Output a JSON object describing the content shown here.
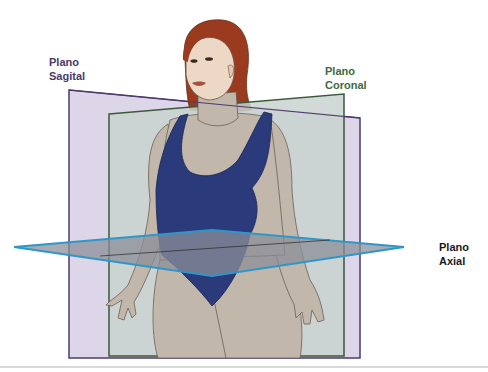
{
  "labels": {
    "sagittal": {
      "line1": "Plano",
      "line2": "Sagital",
      "color": "#4a3a6a"
    },
    "coronal": {
      "line1": "Plano",
      "line2": "Coronal",
      "color": "#3e6a3e"
    },
    "axial": {
      "line1": "Plano",
      "line2": "Axial",
      "color": "#1a1a1a"
    }
  },
  "colors": {
    "sagittal_fill": "#d9d2e6",
    "sagittal_stroke": "#4e3a6e",
    "coronal_fill": "#c9d4cf",
    "coronal_stroke": "#3a5a3a",
    "axial_fill": "#8b8f98",
    "axial_stroke": "#2f97c8",
    "skin": "#c2b7ab",
    "swimsuit": "#2a3a7a",
    "hair": "#9a3a1e",
    "face": "#ecd8c4"
  }
}
